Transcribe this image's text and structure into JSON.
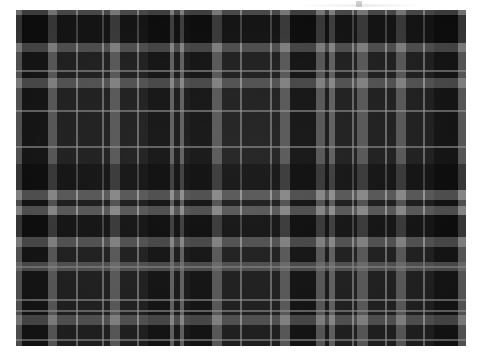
{
  "page": {
    "background_color": "#ffffff",
    "width": 486,
    "height": 358
  },
  "swatch": {
    "name": "grayscale-tartan-plaid",
    "description": "Black and grey tartan (plaid) woven fabric swatch",
    "left": 16,
    "top": 10,
    "width": 450,
    "height": 336,
    "ground_color": "#101010",
    "weave": "twill"
  },
  "palette": {
    "ground": "#101010",
    "black_block": "#080808",
    "dark_charcoal": "#1c1c1c",
    "mid_charcoal": "#282828",
    "grey_stripe": "#6e6e6e",
    "light_grey_stripe": "#8c8c8c",
    "hairline": "#a0a0a0",
    "page_white": "#ffffff"
  },
  "chart_data": {
    "type": "heatmap",
    "xlabel": "warp position (px)",
    "ylabel": "weft position (px)",
    "grid": true,
    "legend": "none",
    "xlim": [
      0,
      450
    ],
    "ylim": [
      0,
      336
    ],
    "warp": [
      {
        "pos": 0,
        "width": 6,
        "color": "#6e6e6e",
        "kind": "grey-guard"
      },
      {
        "pos": 6,
        "width": 26,
        "color": "#080808",
        "kind": "black-block"
      },
      {
        "pos": 32,
        "width": 9,
        "color": "#7a7a7a",
        "kind": "grey-bar"
      },
      {
        "pos": 41,
        "width": 27,
        "color": "#1c1c1c",
        "kind": "charcoal"
      },
      {
        "pos": 60,
        "width": 2,
        "color": "#9a9a9a",
        "kind": "hairline"
      },
      {
        "pos": 68,
        "width": 26,
        "color": "#1c1c1c",
        "kind": "charcoal"
      },
      {
        "pos": 86,
        "width": 2,
        "color": "#9a9a9a",
        "kind": "hairline"
      },
      {
        "pos": 94,
        "width": 10,
        "color": "#7e7e7e",
        "kind": "grey-bar"
      },
      {
        "pos": 104,
        "width": 28,
        "color": "#1c1c1c",
        "kind": "charcoal"
      },
      {
        "pos": 121,
        "width": 2,
        "color": "#9a9a9a",
        "kind": "hairline"
      },
      {
        "pos": 132,
        "width": 22,
        "color": "#080808",
        "kind": "black-block"
      },
      {
        "pos": 154,
        "width": 4,
        "color": "#8c8c8c",
        "kind": "narrow-grey"
      },
      {
        "pos": 158,
        "width": 6,
        "color": "#121212",
        "kind": "gap"
      },
      {
        "pos": 164,
        "width": 4,
        "color": "#8c8c8c",
        "kind": "narrow-grey"
      },
      {
        "pos": 168,
        "width": 6,
        "color": "#121212",
        "kind": "gap"
      },
      {
        "pos": 174,
        "width": 22,
        "color": "#080808",
        "kind": "black-block"
      },
      {
        "pos": 196,
        "width": 10,
        "color": "#7e7e7e",
        "kind": "grey-bar"
      },
      {
        "pos": 206,
        "width": 30,
        "color": "#1c1c1c",
        "kind": "charcoal"
      },
      {
        "pos": 224,
        "width": 2,
        "color": "#9a9a9a",
        "kind": "hairline"
      },
      {
        "pos": 236,
        "width": 28,
        "color": "#1c1c1c",
        "kind": "charcoal"
      },
      {
        "pos": 254,
        "width": 2,
        "color": "#9a9a9a",
        "kind": "hairline"
      },
      {
        "pos": 264,
        "width": 10,
        "color": "#7e7e7e",
        "kind": "grey-bar"
      },
      {
        "pos": 274,
        "width": 26,
        "color": "#080808",
        "kind": "black-block"
      },
      {
        "pos": 300,
        "width": 9,
        "color": "#7a7a7a",
        "kind": "grey-bar"
      },
      {
        "pos": 309,
        "width": 4,
        "color": "#121212",
        "kind": "gap"
      },
      {
        "pos": 313,
        "width": 6,
        "color": "#8c8c8c",
        "kind": "narrow-grey"
      },
      {
        "pos": 319,
        "width": 22,
        "color": "#1c1c1c",
        "kind": "charcoal"
      },
      {
        "pos": 336,
        "width": 2,
        "color": "#9a9a9a",
        "kind": "hairline"
      },
      {
        "pos": 341,
        "width": 11,
        "color": "#7e7e7e",
        "kind": "grey-bar"
      },
      {
        "pos": 352,
        "width": 28,
        "color": "#1c1c1c",
        "kind": "charcoal"
      },
      {
        "pos": 369,
        "width": 2,
        "color": "#9a9a9a",
        "kind": "hairline"
      },
      {
        "pos": 380,
        "width": 10,
        "color": "#7e7e7e",
        "kind": "grey-bar"
      },
      {
        "pos": 390,
        "width": 28,
        "color": "#1c1c1c",
        "kind": "charcoal"
      },
      {
        "pos": 407,
        "width": 2,
        "color": "#9a9a9a",
        "kind": "hairline"
      },
      {
        "pos": 418,
        "width": 24,
        "color": "#080808",
        "kind": "black-block"
      },
      {
        "pos": 442,
        "width": 8,
        "color": "#7a7a7a",
        "kind": "grey-guard"
      }
    ],
    "weft": [
      {
        "pos": 0,
        "height": 5,
        "color": "#6e6e6e",
        "kind": "grey-guard"
      },
      {
        "pos": 5,
        "height": 28,
        "color": "#0a0a0a",
        "kind": "black-band"
      },
      {
        "pos": 33,
        "height": 9,
        "color": "#7a7a7a",
        "kind": "grey-bar"
      },
      {
        "pos": 42,
        "height": 26,
        "color": "#1c1c1c",
        "kind": "charcoal"
      },
      {
        "pos": 60,
        "height": 2,
        "color": "#9a9a9a",
        "kind": "hairline"
      },
      {
        "pos": 68,
        "height": 10,
        "color": "#8080 80",
        "kind": "grey-bar"
      },
      {
        "pos": 78,
        "height": 38,
        "color": "#1c1c1c",
        "kind": "charcoal"
      },
      {
        "pos": 100,
        "height": 2,
        "color": "#9a9a9a",
        "kind": "hairline"
      },
      {
        "pos": 116,
        "height": 38,
        "color": "#1c1c1c",
        "kind": "charcoal"
      },
      {
        "pos": 136,
        "height": 2,
        "color": "#9a9a9a",
        "kind": "hairline"
      },
      {
        "pos": 154,
        "height": 26,
        "color": "#0a0a0a",
        "kind": "black-band"
      },
      {
        "pos": 180,
        "height": 10,
        "color": "#8c8c8c",
        "kind": "grey-bar"
      },
      {
        "pos": 190,
        "height": 6,
        "color": "#141414",
        "kind": "gap"
      },
      {
        "pos": 196,
        "height": 9,
        "color": "#8c8c8c",
        "kind": "grey-bar"
      },
      {
        "pos": 205,
        "height": 22,
        "color": "#0a0a0a",
        "kind": "black-band"
      },
      {
        "pos": 227,
        "height": 10,
        "color": "#7e7e7e",
        "kind": "grey-bar"
      },
      {
        "pos": 237,
        "height": 34,
        "color": "#1c1c1c",
        "kind": "charcoal"
      },
      {
        "pos": 256,
        "height": 2,
        "color": "#9a9a9a",
        "kind": "hairline"
      },
      {
        "pos": 271,
        "height": 34,
        "color": "#1c1c1c",
        "kind": "charcoal"
      },
      {
        "pos": 289,
        "height": 2,
        "color": "#9a9a9a",
        "kind": "hairline"
      },
      {
        "pos": 252,
        "height": 9,
        "color": "#7a7a7a",
        "kind": "grey-bar"
      },
      {
        "pos": 305,
        "height": 10,
        "color": "#7e7e7e",
        "kind": "grey-bar"
      },
      {
        "pos": 315,
        "height": 26,
        "color": "#1c1c1c",
        "kind": "charcoal"
      },
      {
        "pos": 300,
        "height": 2,
        "color": "#9a9a9a",
        "kind": "hairline"
      },
      {
        "pos": 329,
        "height": 2,
        "color": "#9a9a9a",
        "kind": "hairline"
      },
      {
        "pos": 341,
        "height": 30,
        "color": "#0a0a0a",
        "kind": "black-band"
      },
      {
        "pos": 371,
        "height": 9,
        "color": "#7a7a7a",
        "kind": "grey-bar"
      },
      {
        "pos": 380,
        "height": 24,
        "color": "#1c1c1c",
        "kind": "charcoal"
      },
      {
        "pos": 404,
        "height": 9,
        "color": "#8c8c8c",
        "kind": "grey-bar"
      },
      {
        "pos": 413,
        "height": 22,
        "color": "#0a0a0a",
        "kind": "black-band"
      }
    ]
  },
  "artifacts": {
    "top_mark_label": "scan-artifact"
  }
}
